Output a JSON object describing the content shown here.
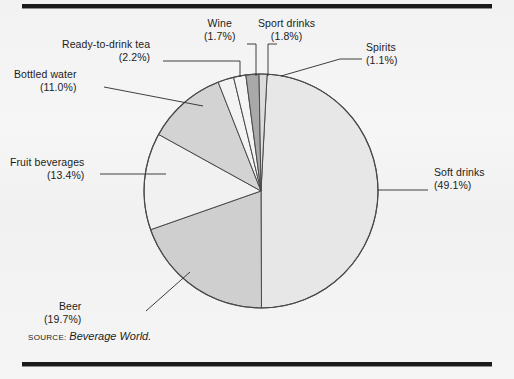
{
  "figure": {
    "background_color": "#f3f3f3",
    "rule_color": "#1b1b1b"
  },
  "source": {
    "prefix": "SOURCE:",
    "publication": "Beverage World."
  },
  "chart_data": {
    "type": "pie",
    "title": "",
    "legend_position": "callout-labels",
    "grid": false,
    "start_angle_deg": 3.0,
    "direction": "clockwise",
    "categories": [
      "Soft drinks",
      "Beer",
      "Fruit beverages",
      "Bottled water",
      "Ready-to-drink tea",
      "Wine",
      "Sport drinks",
      "Spirits"
    ],
    "values": [
      49.1,
      19.7,
      13.4,
      11.0,
      2.2,
      1.7,
      1.8,
      1.1
    ],
    "unit": "%",
    "slices": [
      {
        "label": "Soft drinks",
        "value": 49.1,
        "pct_text": "(49.1%)",
        "color": "#e7e7e7",
        "label_align": "left",
        "label_x": 434,
        "label_y": 166,
        "leader": [
          [
            378,
            190
          ],
          [
            428,
            190
          ]
        ]
      },
      {
        "label": "Beer",
        "value": 19.7,
        "pct_text": "(19.7%)",
        "color": "#cfcfcf",
        "label_align": "right",
        "label_x": 44,
        "label_y": 300,
        "leader": [
          [
            190,
            272
          ],
          [
            146,
            311
          ]
        ]
      },
      {
        "label": "Fruit beverages",
        "value": 13.4,
        "pct_text": "(13.4%)",
        "color": "#f1f1f1",
        "label_align": "right",
        "label_x": 10,
        "label_y": 156,
        "leader": [
          [
            166,
            174
          ],
          [
            100,
            174
          ]
        ]
      },
      {
        "label": "Bottled water",
        "value": 11.0,
        "pct_text": "(11.0%)",
        "color": "#d3d3d3",
        "label_align": "right",
        "label_x": 14,
        "label_y": 68,
        "leader": [
          [
            203,
            106
          ],
          [
            104,
            87
          ]
        ]
      },
      {
        "label": "Ready-to-drink tea",
        "value": 2.2,
        "pct_text": "(2.2%)",
        "color": "#f3f3f3",
        "label_align": "right",
        "label_x": 62,
        "label_y": 38,
        "leader": [
          [
            240,
            77
          ],
          [
            240,
            61
          ],
          [
            163,
            61
          ]
        ]
      },
      {
        "label": "Wine",
        "value": 1.7,
        "pct_text": "(1.7%)",
        "color": "#f5f5f5",
        "label_align": "center",
        "label_x": 204,
        "label_y": 17,
        "leader": [
          [
            256,
            76
          ],
          [
            256,
            44
          ],
          [
            247,
            44
          ]
        ]
      },
      {
        "label": "Sport drinks",
        "value": 1.8,
        "pct_text": "(1.8%)",
        "color": "#a9a9a9",
        "label_align": "center",
        "label_x": 258,
        "label_y": 17,
        "leader": [
          [
            268,
            76
          ],
          [
            268,
            44
          ],
          [
            277,
            44
          ]
        ]
      },
      {
        "label": "Spirits",
        "value": 1.1,
        "pct_text": "(1.1%)",
        "color": "#dcdcdc",
        "label_align": "left",
        "label_x": 366,
        "label_y": 41,
        "leader": [
          [
            281,
            76
          ],
          [
            340,
            59
          ],
          [
            362,
            59
          ]
        ]
      }
    ],
    "pie_geometry": {
      "center_x": 261,
      "center_y": 191,
      "radius": 117,
      "outline_color": "#4a4a4a"
    }
  }
}
